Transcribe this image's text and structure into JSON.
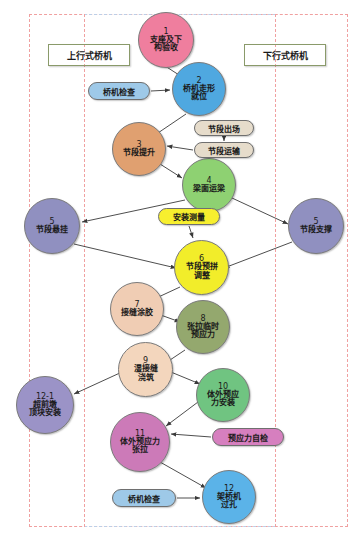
{
  "diagram": {
    "lanes": [
      {
        "id": "lane-up",
        "label": "上行式桥机",
        "color": "#c5e08a"
      },
      {
        "id": "lane-down",
        "label": "下行式桥机",
        "color": "#c5e08a"
      }
    ],
    "nodes": [
      {
        "id": "n1",
        "num": "1",
        "label": "支座及下\n构验收",
        "color": "#ef7e9e",
        "x": 138,
        "y": 12,
        "size": 56
      },
      {
        "id": "n2",
        "num": "2",
        "label": "桥机走形\n就位",
        "color": "#4fa8e0",
        "x": 172,
        "y": 62,
        "size": 54
      },
      {
        "id": "n3",
        "num": "3",
        "label": "节段提升",
        "color": "#e0a070",
        "x": 112,
        "y": 122,
        "size": 54
      },
      {
        "id": "n4",
        "num": "4",
        "label": "梁面运梁",
        "color": "#8ed172",
        "x": 182,
        "y": 158,
        "size": 54
      },
      {
        "id": "n5l",
        "num": "5",
        "label": "节段悬挂",
        "color": "#9090c0",
        "x": 24,
        "y": 198,
        "size": 56
      },
      {
        "id": "n5r",
        "num": "5",
        "label": "节段支撑",
        "color": "#9090c0",
        "x": 288,
        "y": 198,
        "size": 56
      },
      {
        "id": "n6",
        "num": "6",
        "label": "节段预拼\n调整",
        "color": "#f2ed2a",
        "x": 174,
        "y": 240,
        "size": 55
      },
      {
        "id": "n7",
        "num": "7",
        "label": "接缝涂胶",
        "color": "#f0cdb4",
        "x": 110,
        "y": 282,
        "size": 54
      },
      {
        "id": "n8",
        "num": "8",
        "label": "张拉临时\n预应力",
        "color": "#94a86e",
        "x": 176,
        "y": 300,
        "size": 54
      },
      {
        "id": "n9",
        "num": "9",
        "label": "湿接缝\n浇筑",
        "color": "#f3d6bd",
        "x": 118,
        "y": 342,
        "size": 55
      },
      {
        "id": "n121",
        "num": "12-1",
        "label": "超前墩\n顶块安装",
        "color": "#9b93c7",
        "x": 16,
        "y": 376,
        "size": 58
      },
      {
        "id": "n10",
        "num": "10",
        "label": "体外预应\n力安装",
        "color": "#70c481",
        "x": 196,
        "y": 368,
        "size": 54
      },
      {
        "id": "n11",
        "num": "11",
        "label": "体外预应力\n张拉",
        "color": "#cc7ab8",
        "x": 110,
        "y": 412,
        "size": 60
      },
      {
        "id": "n12",
        "num": "12",
        "label": "架桥机\n过孔",
        "color": "#5bb3e8",
        "x": 202,
        "y": 470,
        "size": 54
      }
    ],
    "pills": [
      {
        "id": "p-crane-check-top",
        "label": "桥机检查",
        "color": "#9ec9e8",
        "x": 88,
        "y": 82,
        "w": 62,
        "h": 18
      },
      {
        "id": "p-seg-out",
        "label": "节段出场",
        "color": "#e6dccb",
        "x": 194,
        "y": 120,
        "w": 60,
        "h": 16
      },
      {
        "id": "p-seg-transport",
        "label": "节段运输",
        "color": "#e6dccb",
        "x": 194,
        "y": 142,
        "w": 60,
        "h": 16
      },
      {
        "id": "p-install-survey",
        "label": "安装测量",
        "color": "#f7ef2e",
        "x": 158,
        "y": 208,
        "w": 62,
        "h": 17
      },
      {
        "id": "p-ps-selfcheck",
        "label": "预应力自检",
        "color": "#d67fbf",
        "x": 212,
        "y": 428,
        "w": 72,
        "h": 18
      },
      {
        "id": "p-crane-check-bot",
        "label": "桥机检查",
        "color": "#9ec9e8",
        "x": 112,
        "y": 489,
        "w": 64,
        "h": 18
      }
    ],
    "edges": [
      {
        "from": "n1",
        "to": "n2",
        "path": "M 162,64 L 193,84"
      },
      {
        "from": "p-crane-check-top",
        "to": "n2",
        "path": "M 151,91 L 170,90"
      },
      {
        "from": "n2",
        "to": "n3",
        "path": "M 186,114 L 152,137"
      },
      {
        "from": "p-seg-out",
        "to": "p-seg-transport",
        "path": "M 224,137 L 224,141"
      },
      {
        "from": "p-seg-transport",
        "to": "n3",
        "path": "M 193,150 L 167,146"
      },
      {
        "from": "n3",
        "to": "n4",
        "path": "M 160,164 L 182,178"
      },
      {
        "from": "n4",
        "to": "n5l",
        "path": "M 185,200 L 82,222"
      },
      {
        "from": "n4",
        "to": "n5r",
        "path": "M 232,198 L 288,224"
      },
      {
        "from": "p-install-survey",
        "to": "n6",
        "path": "M 189,226 L 193,238"
      },
      {
        "from": "n5l",
        "to": "n6",
        "path": "M 74,244 L 176,268"
      },
      {
        "from": "n5r",
        "to": "n6",
        "path": "M 292,242 L 224,268"
      },
      {
        "from": "n6",
        "to": "n7",
        "path": "M 180,287 L 152,300"
      },
      {
        "from": "n7",
        "to": "n8",
        "path": "M 158,314 L 180,322"
      },
      {
        "from": "n8",
        "to": "n9",
        "path": "M 185,350 L 164,364"
      },
      {
        "from": "n9",
        "to": "n121",
        "path": "M 122,372 L 74,394"
      },
      {
        "from": "n9",
        "to": "n10",
        "path": "M 166,370 L 200,384"
      },
      {
        "from": "n10",
        "to": "n11",
        "path": "M 198,402 L 166,426"
      },
      {
        "from": "p-ps-selfcheck",
        "to": "n11",
        "path": "M 211,437 L 171,434"
      },
      {
        "from": "n11",
        "to": "n12",
        "path": "M 160,462 L 206,488"
      },
      {
        "from": "p-crane-check-bot",
        "to": "n12",
        "path": "M 177,498 L 200,498"
      }
    ]
  }
}
